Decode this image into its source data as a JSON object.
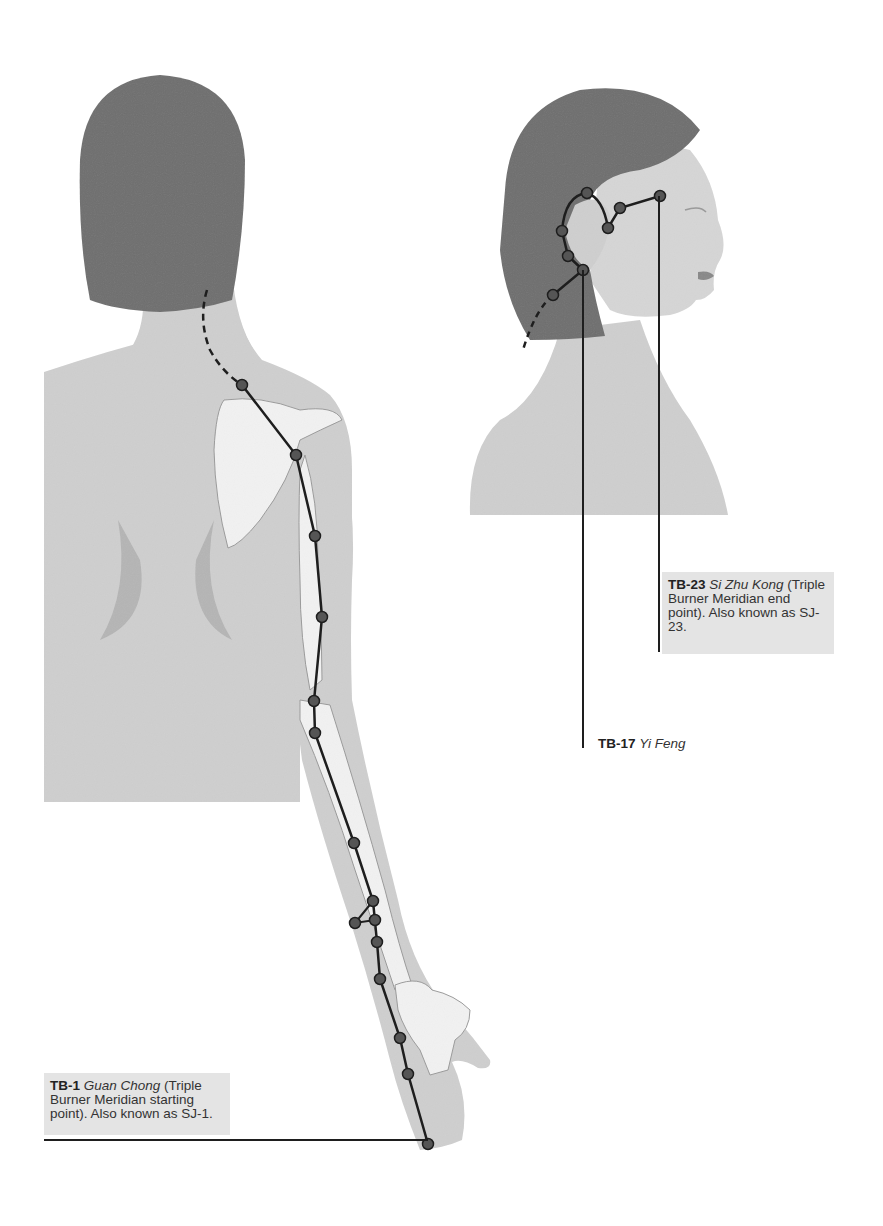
{
  "figure": {
    "title": "Triple Burner Meridian",
    "colors": {
      "background": "#ffffff",
      "skin": "#cfcfcf",
      "skin_shadow": "#b5b5b5",
      "hair": "#6e6e6e",
      "bone": "#f2f2f2",
      "bone_outline": "#9a9a9a",
      "meridian_line": "#1e1e1e",
      "point_fill": "#555555",
      "label_bg": "#e4e4e4"
    }
  },
  "labels": {
    "tb1": {
      "code": "TB-1",
      "name": "Guan Chong",
      "desc": " (Triple Burner Meridian starting point). Also known as SJ-1."
    },
    "tb23": {
      "code": "TB-23",
      "name": "Si Zhu Kong",
      "desc": " (Triple Burner Meridian end point). Also known as SJ-23."
    },
    "tb17": {
      "code": "TB-17",
      "name": "Yi Feng"
    }
  },
  "points": {
    "back_view": [
      [
        242,
        385
      ],
      [
        296,
        455
      ],
      [
        315,
        536
      ],
      [
        322,
        617
      ],
      [
        314,
        701
      ],
      [
        315,
        733
      ],
      [
        354,
        843
      ],
      [
        373,
        901
      ],
      [
        355,
        923
      ],
      [
        375,
        920
      ],
      [
        377,
        942
      ],
      [
        380,
        979
      ],
      [
        400,
        1038
      ],
      [
        408,
        1074
      ],
      [
        428,
        1144
      ]
    ],
    "head_view": [
      [
        587,
        193
      ],
      [
        620,
        208
      ],
      [
        608,
        228
      ],
      [
        562,
        231
      ],
      [
        568,
        256
      ],
      [
        583,
        270
      ],
      [
        553,
        295
      ],
      [
        660,
        196
      ]
    ]
  }
}
